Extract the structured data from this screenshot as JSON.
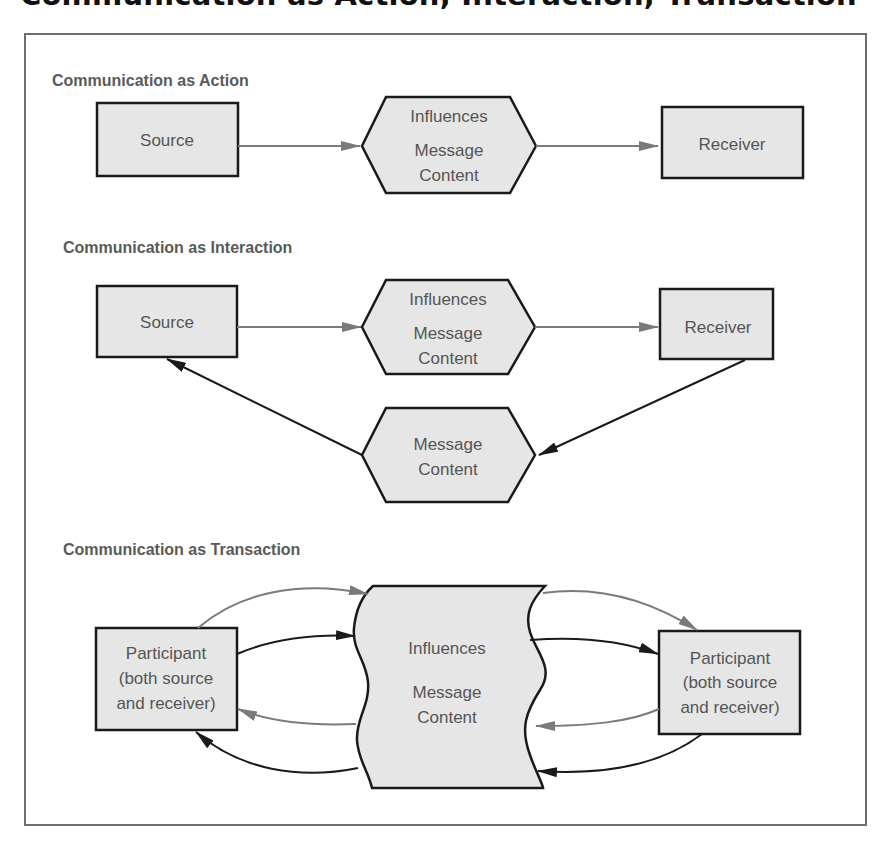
{
  "title": "Communication as Action, Interaction, Transaction",
  "colors": {
    "box_fill": "#e6e6e6",
    "box_stroke": "#1a1a1a",
    "text": "#555555",
    "heading_text": "#5a5a5a",
    "frame_stroke": "#6e6e6e",
    "gray_arrow": "#7a7a7a",
    "black_arrow": "#1a1a1a"
  },
  "sections": {
    "action": {
      "heading": "Communication as Action",
      "source": {
        "label": "Source"
      },
      "message": {
        "line1": "Influences",
        "line2": "Message",
        "line3": "Content"
      },
      "receiver": {
        "label": "Receiver"
      },
      "arrows": [
        {
          "from": "source",
          "to": "message",
          "color": "gray"
        },
        {
          "from": "message",
          "to": "receiver",
          "color": "gray"
        }
      ]
    },
    "interaction": {
      "heading": "Communication as Interaction",
      "source": {
        "label": "Source"
      },
      "message": {
        "line1": "Influences",
        "line2": "Message",
        "line3": "Content"
      },
      "receiver": {
        "label": "Receiver"
      },
      "feedback": {
        "line1": "Message",
        "line2": "Content"
      },
      "arrows": [
        {
          "from": "source",
          "to": "message",
          "color": "gray"
        },
        {
          "from": "message",
          "to": "receiver",
          "color": "gray"
        },
        {
          "from": "receiver",
          "to": "feedback",
          "color": "black"
        },
        {
          "from": "feedback",
          "to": "source",
          "color": "black"
        }
      ]
    },
    "transaction": {
      "heading": "Communication as Transaction",
      "participant_left": {
        "line1": "Participant",
        "line2": "(both source",
        "line3": "and receiver)"
      },
      "message": {
        "line1": "Influences",
        "line2": "Message",
        "line3": "Content"
      },
      "participant_right": {
        "line1": "Participant",
        "line2": "(both source",
        "line3": "and receiver)"
      },
      "arrows": [
        {
          "from": "participant_left",
          "to": "message",
          "color": "gray"
        },
        {
          "from": "participant_left",
          "to": "message",
          "color": "black"
        },
        {
          "from": "message",
          "to": "participant_left",
          "color": "gray"
        },
        {
          "from": "message",
          "to": "participant_left",
          "color": "black"
        },
        {
          "from": "message",
          "to": "participant_right",
          "color": "gray"
        },
        {
          "from": "message",
          "to": "participant_right",
          "color": "black"
        },
        {
          "from": "participant_right",
          "to": "message",
          "color": "gray"
        },
        {
          "from": "participant_right",
          "to": "message",
          "color": "black"
        }
      ]
    }
  }
}
